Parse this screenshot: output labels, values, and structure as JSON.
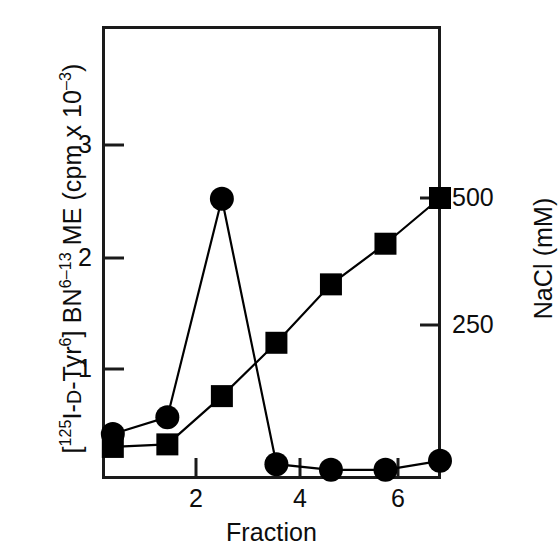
{
  "chart_data": {
    "type": "line",
    "title": "",
    "xlabel": "Fraction",
    "ylabel": "[125I-D-Tyr6] BN6-13 ME (cpm x 10-3)",
    "y2label": "NaCl (mM)",
    "x": [
      1,
      2,
      3,
      4,
      5,
      6,
      7
    ],
    "xlim": [
      0.82,
      7.0
    ],
    "ylim": [
      0,
      4.05
    ],
    "y2lim": [
      0,
      860
    ],
    "grid": false,
    "legend_position": "none",
    "xticks": [
      "2",
      "4",
      "6"
    ],
    "xtick_values": [
      2,
      4,
      6
    ],
    "yticks": [
      "1",
      "2",
      "3"
    ],
    "ytick_values": [
      1,
      2,
      3
    ],
    "y2ticks": [
      "250",
      "500"
    ],
    "y2tick_values": [
      250,
      500
    ],
    "series": [
      {
        "name": "[125I-D-Tyr6] BN6-13 ME",
        "marker": "circle",
        "axis": "left",
        "values": [
          0.42,
          0.57,
          2.52,
          0.15,
          0.1,
          0.1,
          0.18
        ]
      },
      {
        "name": "NaCl",
        "marker": "square",
        "axis": "right",
        "values": [
          10,
          15,
          110,
          215,
          330,
          410,
          500
        ]
      }
    ]
  },
  "labels": {
    "ylabel_left_parts": {
      "bracket_open": "[",
      "iso": "125",
      "iodine": "I-",
      "d_small": "D",
      "tyr": "-Tyr",
      "tyr_sup": "6",
      "bracket_close": "] BN",
      "bn_sup": "6–13",
      "me": " ME (cpm x 10",
      "exp": "–3",
      "tail": ")"
    },
    "ylabel_right": "NaCl (mM)",
    "xlabel": "Fraction"
  },
  "colors": {
    "ink": "#0d0d0d",
    "background": "#ffffff",
    "marker": "#000000",
    "axis": "#1a1a1a"
  }
}
